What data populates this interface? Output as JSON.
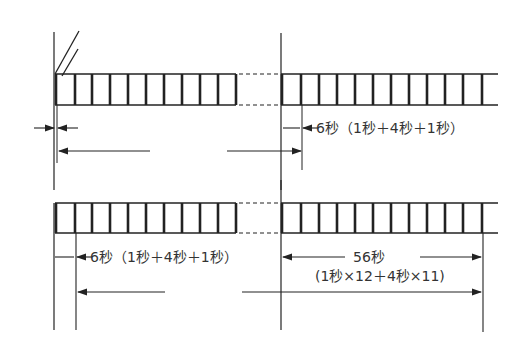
{
  "diagram": {
    "type": "timing-diagram",
    "line_color": "#222222",
    "background": "#ffffff",
    "rows": [
      {
        "id": "top-row",
        "pulse_count_left": 10,
        "pulse_count_right": 12,
        "annotations": {
          "interval_label": "6秒（1秒＋4秒＋1秒）"
        }
      },
      {
        "id": "bottom-row",
        "pulse_count_left": 10,
        "pulse_count_right": 12,
        "annotations": {
          "interval_label": "6秒（1秒＋4秒＋1秒）",
          "duration_label": "56秒",
          "duration_formula": "(1秒×12＋4秒×11)"
        }
      }
    ]
  }
}
